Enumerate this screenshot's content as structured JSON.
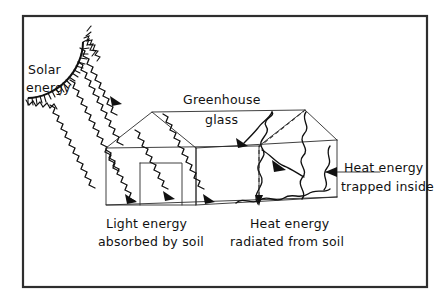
{
  "figure": {
    "background_color": "#ffffff",
    "ink_color": "#111111",
    "frame_color": "#2e2e2e",
    "frame_width": 2.2
  },
  "labels": {
    "solar_energy_line1": "Solar",
    "solar_energy_line2": "energy",
    "greenhouse_glass_line1": "Greenhouse",
    "greenhouse_glass_line2": "glass",
    "heat_trapped_line1": "Heat energy",
    "heat_trapped_line2": "trapped inside",
    "light_absorbed_line1": "Light energy",
    "light_absorbed_line2": "absorbed by soil",
    "heat_radiated_line1": "Heat energy",
    "heat_radiated_line2": "radiated from soil"
  },
  "elements": {
    "sun_name": "sun-arc",
    "greenhouse_name": "greenhouse-structure",
    "solar_rays_name": "solar-ray-zigzags",
    "heat_waves_name": "heat-wave-squiggles",
    "dashed_lines_name": "dashed-reference-lines"
  },
  "geometry": {
    "frame": {
      "x": 22,
      "y": 15,
      "width": 406,
      "height": 273
    },
    "sun_center": {
      "x": 2,
      "y": 30
    },
    "sun_radius": 68,
    "greenhouse": {
      "front_peak": {
        "x": 152,
        "y": 112
      },
      "front_left": {
        "x": 106,
        "y": 148
      },
      "front_right": {
        "x": 196,
        "y": 148
      },
      "back_peak": {
        "x": 305,
        "y": 110
      },
      "base_y": 205,
      "right_x": 337
    },
    "door": {
      "x": 140,
      "y": 163,
      "width": 42,
      "height": 42
    }
  }
}
